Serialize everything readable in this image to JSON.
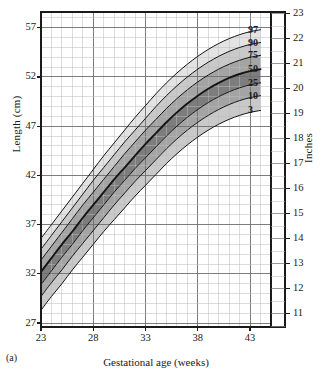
{
  "figure": {
    "panel_label": "(a)",
    "background": "#ffffff"
  },
  "axes": {
    "x": {
      "title": "Gestational age (weeks)",
      "ticks": [
        23,
        28,
        33,
        38,
        43
      ],
      "min": 23,
      "max": 45,
      "minor_step": 1,
      "major_step": 5
    },
    "y_left": {
      "title": "Length (cm)",
      "ticks": [
        27,
        32,
        37,
        42,
        47,
        52,
        57
      ],
      "min": 26.6,
      "max": 58.6,
      "minor_step": 1,
      "major_step": 5
    },
    "y_right": {
      "title": "Inches",
      "ticks": [
        11,
        12,
        13,
        14,
        15,
        16,
        17,
        18,
        19,
        20,
        21,
        22,
        23
      ],
      "min": 10.47,
      "max": 23.07
    }
  },
  "grid": {
    "minor_color": "#b9b9b9",
    "major_color": "#6f6f6f",
    "frame_color": "#1a1a1a",
    "show": true
  },
  "chart_data": {
    "type": "line",
    "title": "",
    "subtitle": "",
    "xlabel": "Gestational age (weeks)",
    "ylabel": "Length (cm)",
    "ylabel_secondary": "Inches",
    "xlim": [
      23,
      45
    ],
    "ylim": [
      26.6,
      58.6
    ],
    "ylim_secondary": [
      10.47,
      23.07
    ],
    "grid": true,
    "legend": "inline-right-end-labels",
    "x": [
      23,
      24,
      25,
      26,
      27,
      28,
      29,
      30,
      31,
      32,
      33,
      34,
      35,
      36,
      37,
      38,
      39,
      40,
      41,
      42,
      43,
      44
    ],
    "series": [
      {
        "name": "97",
        "label": "97",
        "band_fill": "#e3e3e3",
        "values": [
          35.6,
          37.0,
          38.4,
          39.8,
          41.2,
          42.6,
          44.0,
          45.3,
          46.6,
          47.9,
          49.1,
          50.3,
          51.4,
          52.4,
          53.3,
          54.1,
          54.8,
          55.4,
          55.9,
          56.3,
          56.6,
          56.8
        ]
      },
      {
        "name": "90",
        "label": "90",
        "band_fill": "#c9c9c9",
        "values": [
          34.5,
          35.9,
          37.3,
          38.7,
          40.1,
          41.5,
          42.8,
          44.1,
          45.4,
          46.6,
          47.8,
          49.0,
          50.1,
          51.1,
          52.0,
          52.8,
          53.5,
          54.1,
          54.6,
          55.0,
          55.3,
          55.5
        ]
      },
      {
        "name": "75",
        "label": "75",
        "band_fill": "#a4a4a4",
        "values": [
          33.4,
          34.8,
          36.2,
          37.6,
          39.0,
          40.3,
          41.6,
          42.9,
          44.2,
          45.4,
          46.6,
          47.7,
          48.8,
          49.8,
          50.7,
          51.5,
          52.2,
          52.8,
          53.3,
          53.7,
          54.0,
          54.2
        ]
      },
      {
        "name": "50",
        "label": "50",
        "band_fill": "#7d7d7d",
        "values": [
          32.2,
          33.6,
          35.0,
          36.3,
          37.7,
          39.0,
          40.3,
          41.6,
          42.8,
          44.0,
          45.2,
          46.3,
          47.4,
          48.4,
          49.3,
          50.1,
          50.8,
          51.4,
          51.9,
          52.3,
          52.6,
          52.8
        ]
      },
      {
        "name": "25",
        "label": "25",
        "band_fill": "#a4a4a4",
        "values": [
          30.9,
          32.3,
          33.7,
          35.0,
          36.4,
          37.7,
          39.0,
          40.3,
          41.5,
          42.7,
          43.8,
          44.9,
          46.0,
          47.0,
          47.9,
          48.7,
          49.4,
          50.0,
          50.5,
          50.9,
          51.2,
          51.4
        ]
      },
      {
        "name": "10",
        "label": "10",
        "band_fill": "#c9c9c9",
        "values": [
          29.7,
          31.1,
          32.4,
          33.8,
          35.1,
          36.4,
          37.7,
          39.0,
          40.2,
          41.4,
          42.5,
          43.6,
          44.7,
          45.7,
          46.6,
          47.4,
          48.1,
          48.7,
          49.2,
          49.6,
          49.9,
          50.1
        ]
      },
      {
        "name": "3",
        "label": "3",
        "band_fill": "#e3e3e3",
        "values": [
          28.3,
          29.7,
          31.0,
          32.4,
          33.7,
          35.0,
          36.3,
          37.5,
          38.7,
          39.9,
          41.0,
          42.1,
          43.2,
          44.2,
          45.1,
          45.9,
          46.6,
          47.2,
          47.7,
          48.1,
          48.4,
          48.6
        ]
      }
    ],
    "curve_color": "#141414",
    "median_emphasis": true
  }
}
